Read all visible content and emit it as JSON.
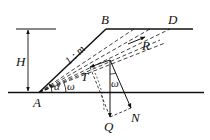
{
  "diagram": {
    "type": "slope-stability-force-diagram",
    "labels": {
      "A": "A",
      "B": "B",
      "D": "D",
      "H": "H",
      "slope": "1 : m",
      "alpha": "α",
      "omega_base": "ω",
      "omega_force": "ω",
      "T": "T",
      "R": "R",
      "Q": "Q",
      "N": "N"
    },
    "colors": {
      "line": "#111111",
      "background": "#ffffff"
    },
    "points": {
      "A": [
        39,
        93
      ],
      "B": [
        106,
        29
      ],
      "D": [
        170,
        29
      ],
      "O": [
        110,
        60
      ],
      "Q_tip": [
        109,
        117
      ],
      "N_tip": [
        131,
        108
      ],
      "T_tip": [
        90,
        67
      ],
      "R_tip": [
        145,
        37
      ]
    }
  }
}
